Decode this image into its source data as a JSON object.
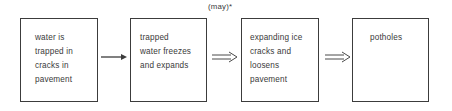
{
  "diagram": {
    "type": "flowchart",
    "direction": "left-to-right",
    "nodes": [
      {
        "id": "box1",
        "label": "water is\ntrapped in\ncracks in\npavement"
      },
      {
        "id": "box2",
        "label": "trapped\nwater freezes\nand expands"
      },
      {
        "id": "box3",
        "label": "expanding ice\ncracks and\nloosens\npavement"
      },
      {
        "id": "box4",
        "label": "potholes"
      }
    ],
    "edges": [
      {
        "from": "box1",
        "to": "box2",
        "style": "single-arrow",
        "label": ""
      },
      {
        "from": "box2",
        "to": "box3",
        "style": "double-arrow",
        "label": "(may)*"
      },
      {
        "from": "box3",
        "to": "box4",
        "style": "double-arrow",
        "label": ""
      }
    ],
    "annotation": "(may)*",
    "colors": {
      "stroke": "#3c3c3c",
      "text": "#3a3a3a",
      "background": "#ffffff"
    }
  }
}
